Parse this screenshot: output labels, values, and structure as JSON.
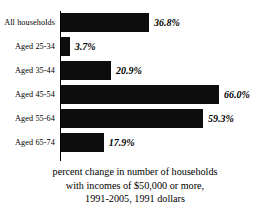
{
  "chart_data": {
    "type": "bar",
    "orientation": "horizontal",
    "title": "",
    "categories": [
      "All households",
      "Aged 25-34",
      "Aged 35-44",
      "Aged 45-54",
      "Aged 55-64",
      "Aged 65-74"
    ],
    "values": [
      36.8,
      3.7,
      20.9,
      66.0,
      59.3,
      17.9
    ],
    "value_labels": [
      "36.8%",
      "3.7%",
      "20.9%",
      "66.0%",
      "59.3%",
      "17.9%"
    ],
    "xlabel": "",
    "ylabel": "",
    "xlim": [
      0,
      66
    ],
    "grid": false,
    "legend": false,
    "bar_color": "#0d0d0d",
    "axis_color": "#000000",
    "background": "#ffffff",
    "caption_lines": [
      "percent change in number of households",
      "with incomes of $50,000 or more,",
      "1991-2005, 1991 dollars"
    ]
  }
}
